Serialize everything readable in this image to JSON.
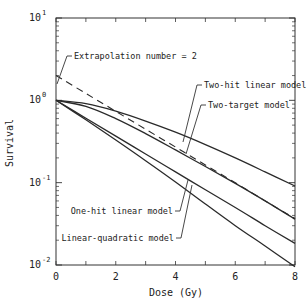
{
  "chart_data": {
    "type": "line",
    "title": "",
    "xlabel": "Dose (Gy)",
    "ylabel": "Survival",
    "xlim": [
      0,
      8
    ],
    "ylim": [
      0.01,
      10
    ],
    "yscale": "log",
    "grid": false,
    "x_ticks": [
      0,
      2,
      4,
      6,
      8
    ],
    "x_tick_labels": [
      "0",
      "2",
      "4",
      "6",
      "8"
    ],
    "y_ticks": [
      10,
      1,
      0.1,
      0.01
    ],
    "y_tick_labels": [
      {
        "base": "10",
        "exp": "1"
      },
      {
        "base": "10",
        "exp": "0"
      },
      {
        "base": "10",
        "exp": "-1"
      },
      {
        "base": "10",
        "exp": "-2"
      }
    ],
    "x": [
      0,
      1,
      2,
      3,
      4,
      5,
      6,
      7,
      8
    ],
    "series": [
      {
        "name": "Two-hit linear model",
        "style": "solid",
        "values": [
          1.0,
          0.91,
          0.74,
          0.56,
          0.41,
          0.29,
          0.2,
          0.135,
          0.091
        ]
      },
      {
        "name": "Two-target model",
        "style": "solid",
        "values": [
          1.0,
          0.845,
          0.6,
          0.394,
          0.25,
          0.157,
          0.098,
          0.06,
          0.036
        ]
      },
      {
        "name": "One-hit linear model",
        "style": "solid",
        "values": [
          1.0,
          0.607,
          0.368,
          0.223,
          0.135,
          0.082,
          0.05,
          0.03,
          0.0183
        ]
      },
      {
        "name": "Linear-quadratic model",
        "style": "solid",
        "values": [
          1.0,
          0.58,
          0.33,
          0.185,
          0.102,
          0.055,
          0.03,
          0.017,
          0.0095
        ]
      },
      {
        "name": "Extrapolation line",
        "style": "dashed",
        "values": [
          2.0,
          1.213,
          0.736,
          0.446,
          0.271,
          0.164,
          0.1,
          0.06,
          0.0366
        ]
      }
    ],
    "annotations": [
      {
        "text": "Extrapolation number = 2",
        "x": 0,
        "y": 2
      },
      {
        "text": "Two-hit linear model"
      },
      {
        "text": "Two-target model"
      },
      {
        "text": "One-hit linear model"
      },
      {
        "text": "Linear-quadratic model"
      }
    ],
    "legend": "none (inline labels with leader lines)"
  },
  "labels": {
    "xlabel": "Dose (Gy)",
    "ylabel": "Survival",
    "extrapolation": "Extrapolation number = 2",
    "two_hit": "Two-hit linear model",
    "two_target": "Two-target model",
    "one_hit": "One-hit linear model",
    "lq": "Linear-quadratic model"
  },
  "style": {
    "line_color": "#2a2a2a",
    "axis_color": "#333333"
  }
}
